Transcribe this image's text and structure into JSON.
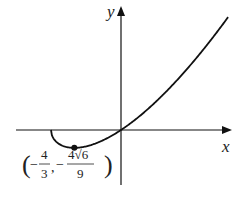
{
  "chart_data": {
    "type": "line",
    "title": "",
    "function": "y = x*sqrt(x+2)",
    "xlabel": "x",
    "ylabel": "y",
    "xlim": [
      -3,
      3.2
    ],
    "ylim": [
      -3.3,
      7.6
    ],
    "grid": false,
    "domain_start": -2,
    "domain_end": 3.06,
    "series": [
      {
        "name": "curve",
        "color": "#111111"
      }
    ],
    "points": [
      {
        "name": "local-minimum",
        "x": -1.3333,
        "y": -1.0887,
        "label": {
          "open": "(",
          "x_sign": "−",
          "x_num": "4",
          "x_den": "3",
          "sep": ",",
          "y_sign": "−",
          "y_num": "4√6",
          "y_den": "9",
          "close": ")"
        }
      }
    ]
  },
  "colors": {
    "axis": "#111111",
    "curve": "#111111",
    "text": "#222222"
  }
}
